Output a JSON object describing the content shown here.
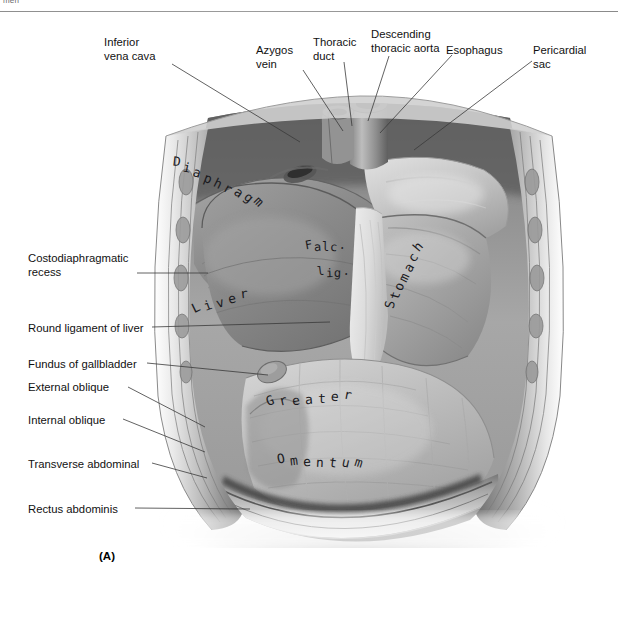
{
  "page": {
    "running_head": "men",
    "figure_label": "(A)",
    "background": "#ffffff",
    "ink_color": "#16161a"
  },
  "figure": {
    "type": "anatomical-illustration",
    "medium": "grayscale airbrush drawing"
  },
  "callouts": [
    {
      "id": "inferior-vena-cava",
      "text": "Inferior\nvena cava",
      "side": "top",
      "x": 104,
      "y": 36,
      "align": "left",
      "line": [
        [
          172,
          64
        ],
        [
          300,
          142
        ]
      ]
    },
    {
      "id": "azygos-vein",
      "text": "Azygos\nvein",
      "side": "top",
      "x": 256,
      "y": 44,
      "align": "left",
      "line": [
        [
          303,
          70
        ],
        [
          343,
          131
        ]
      ]
    },
    {
      "id": "thoracic-duct",
      "text": "Thoracic\nduct",
      "side": "top",
      "x": 313,
      "y": 36,
      "align": "left",
      "line": [
        [
          344,
          62
        ],
        [
          352,
          126
        ]
      ]
    },
    {
      "id": "descending-thoracic-aorta",
      "text": "Descending\nthoracic aorta",
      "side": "top",
      "x": 371,
      "y": 28,
      "align": "left",
      "line": [
        [
          389,
          56
        ],
        [
          368,
          121
        ]
      ]
    },
    {
      "id": "esophagus",
      "text": "Esophagus",
      "side": "top",
      "x": 446,
      "y": 44,
      "align": "left",
      "line": [
        [
          452,
          55
        ],
        [
          380,
          133
        ]
      ]
    },
    {
      "id": "pericardial-sac",
      "text": "Pericardial\nsac",
      "side": "top",
      "x": 533,
      "y": 44,
      "align": "left",
      "line": [
        [
          532,
          61
        ],
        [
          414,
          150
        ]
      ]
    },
    {
      "id": "costodiaphragmatic-recess",
      "text": "Costodiaphragmatic\nrecess",
      "side": "left",
      "x": 28,
      "y": 252,
      "align": "left",
      "line": [
        [
          137,
          273
        ],
        [
          208,
          273
        ]
      ]
    },
    {
      "id": "round-ligament-of-liver",
      "text": "Round ligament of liver",
      "side": "left",
      "x": 28,
      "y": 322,
      "align": "left",
      "line": [
        [
          152,
          327
        ],
        [
          330,
          322
        ]
      ]
    },
    {
      "id": "fundus-of-gallbladder",
      "text": "Fundus of gallbladder",
      "side": "left",
      "x": 28,
      "y": 358,
      "align": "left",
      "line": [
        [
          147,
          363
        ],
        [
          268,
          375
        ]
      ]
    },
    {
      "id": "external-oblique",
      "text": "External oblique",
      "side": "left",
      "x": 28,
      "y": 381,
      "align": "left",
      "line": [
        [
          128,
          387
        ],
        [
          205,
          427
        ]
      ]
    },
    {
      "id": "internal-oblique",
      "text": "Internal oblique",
      "side": "left",
      "x": 28,
      "y": 414,
      "align": "left",
      "line": [
        [
          123,
          419
        ],
        [
          205,
          452
        ]
      ]
    },
    {
      "id": "transverse-abdominal",
      "text": "Transverse abdominal",
      "side": "left",
      "x": 28,
      "y": 458,
      "align": "left",
      "line": [
        [
          152,
          463
        ],
        [
          207,
          478
        ]
      ]
    },
    {
      "id": "rectus-abdominis",
      "text": "Rectus abdominis",
      "side": "left",
      "x": 28,
      "y": 503,
      "align": "left",
      "line": [
        [
          135,
          508
        ],
        [
          250,
          509
        ]
      ]
    }
  ],
  "art_labels": [
    {
      "id": "diaphragm",
      "text": "Diaphragm",
      "x": 214,
      "y": 176,
      "rotate": 26,
      "spacing": 3.4,
      "size": 13
    },
    {
      "id": "falciform-ligament-1",
      "text": "Falc.",
      "x": 322,
      "y": 240,
      "rotate": 0,
      "spacing": 1.0,
      "size": 12
    },
    {
      "id": "falciform-ligament-2",
      "text": "lig.",
      "x": 330,
      "y": 266,
      "rotate": 0,
      "spacing": 1.0,
      "size": 12
    },
    {
      "id": "liver",
      "text": "Liver",
      "x": 216,
      "y": 295,
      "rotate": -16,
      "spacing": 4.2,
      "size": 13
    },
    {
      "id": "stomach",
      "text": "Stomach",
      "x": 400,
      "y": 270,
      "rotate": -64,
      "spacing": 2.6,
      "size": 13
    },
    {
      "id": "greater",
      "text": "Greater",
      "x": 305,
      "y": 392,
      "rotate": -4,
      "spacing": 5.0,
      "size": 13
    },
    {
      "id": "omentum",
      "text": "Omentum",
      "x": 316,
      "y": 455,
      "rotate": 3,
      "spacing": 5.0,
      "size": 13
    }
  ],
  "chart_data": null
}
